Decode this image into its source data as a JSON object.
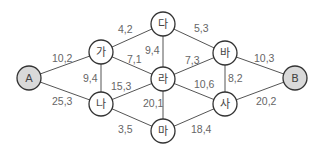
{
  "diagram": {
    "type": "weighted-graph",
    "colors": {
      "terminal_fill": "#d9d9d9",
      "node_fill": "#ffffff",
      "stroke": "#333333",
      "edge": "#555555",
      "text": "#666666"
    },
    "nodes": [
      {
        "id": "A",
        "label": "A",
        "x": 29,
        "y": 78,
        "terminal": true
      },
      {
        "id": "ga",
        "label": "가",
        "x": 101,
        "y": 52,
        "terminal": false
      },
      {
        "id": "na",
        "label": "나",
        "x": 101,
        "y": 104,
        "terminal": false
      },
      {
        "id": "da",
        "label": "다",
        "x": 163,
        "y": 24,
        "terminal": false
      },
      {
        "id": "ra",
        "label": "라",
        "x": 163,
        "y": 79,
        "terminal": false
      },
      {
        "id": "ma",
        "label": "마",
        "x": 163,
        "y": 131,
        "terminal": false
      },
      {
        "id": "ba",
        "label": "바",
        "x": 225,
        "y": 53,
        "terminal": false
      },
      {
        "id": "sa",
        "label": "사",
        "x": 225,
        "y": 104,
        "terminal": false
      },
      {
        "id": "B",
        "label": "B",
        "x": 295,
        "y": 78,
        "terminal": true
      }
    ],
    "edges": [
      {
        "from": "A",
        "to": "ga",
        "label": "10,2",
        "lx": 52,
        "ly": 62
      },
      {
        "from": "A",
        "to": "na",
        "label": "25,3",
        "lx": 52,
        "ly": 105
      },
      {
        "from": "ga",
        "to": "da",
        "label": "4,2",
        "lx": 118,
        "ly": 33
      },
      {
        "from": "ga",
        "to": "ra",
        "label": "7,1",
        "lx": 127,
        "ly": 63
      },
      {
        "from": "ga",
        "to": "na",
        "label": "9,4",
        "lx": 83,
        "ly": 82
      },
      {
        "from": "na",
        "to": "ra",
        "label": "15,3",
        "lx": 111,
        "ly": 90
      },
      {
        "from": "na",
        "to": "ma",
        "label": "3,5",
        "lx": 118,
        "ly": 133
      },
      {
        "from": "da",
        "to": "ra",
        "label": "9,4",
        "lx": 145,
        "ly": 54
      },
      {
        "from": "ra",
        "to": "ma",
        "label": "20,1",
        "lx": 143,
        "ly": 107
      },
      {
        "from": "da",
        "to": "ba",
        "label": "5,3",
        "lx": 194,
        "ly": 32
      },
      {
        "from": "ra",
        "to": "ba",
        "label": "7,3",
        "lx": 185,
        "ly": 64
      },
      {
        "from": "ra",
        "to": "sa",
        "label": "10,6",
        "lx": 194,
        "ly": 88
      },
      {
        "from": "ba",
        "to": "sa",
        "label": "8,2",
        "lx": 228,
        "ly": 82
      },
      {
        "from": "ma",
        "to": "sa",
        "label": "18,4",
        "lx": 191,
        "ly": 133
      },
      {
        "from": "ba",
        "to": "B",
        "label": "10,3",
        "lx": 254,
        "ly": 62
      },
      {
        "from": "sa",
        "to": "B",
        "label": "20,2",
        "lx": 256,
        "ly": 105
      }
    ]
  }
}
